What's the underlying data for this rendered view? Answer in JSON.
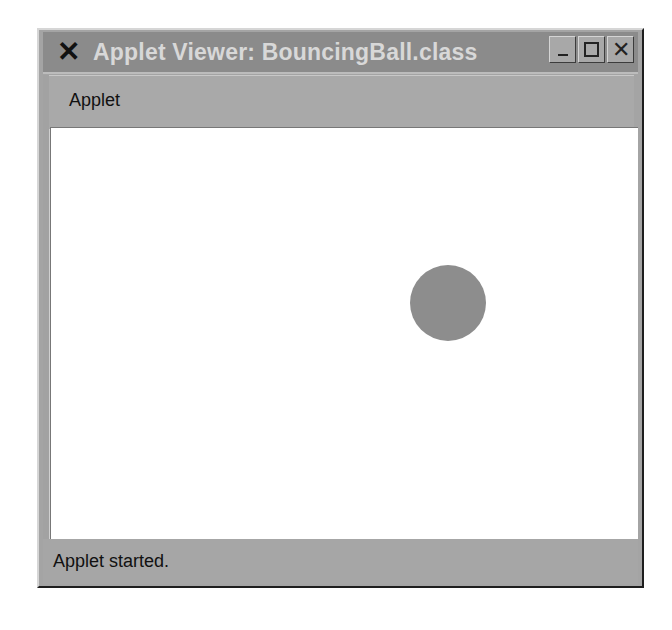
{
  "window": {
    "title": "Applet Viewer: BouncingBall.class",
    "menu_icon": "x-window-menu-icon",
    "buttons": {
      "minimize": "minimize-icon",
      "maximize": "maximize-icon",
      "close_glyph": "✕"
    }
  },
  "menubar": {
    "items": [
      {
        "label": "Applet"
      }
    ]
  },
  "canvas": {
    "ball": {
      "center_x": 397,
      "center_y": 175,
      "radius": 38,
      "color": "#8d8d8d"
    },
    "background": "#ffffff"
  },
  "statusbar": {
    "text": "Applet started."
  },
  "colors": {
    "titlebar": "#8b8b8b",
    "title_text": "#d8d8d8",
    "frame": "#a4a4a4"
  }
}
